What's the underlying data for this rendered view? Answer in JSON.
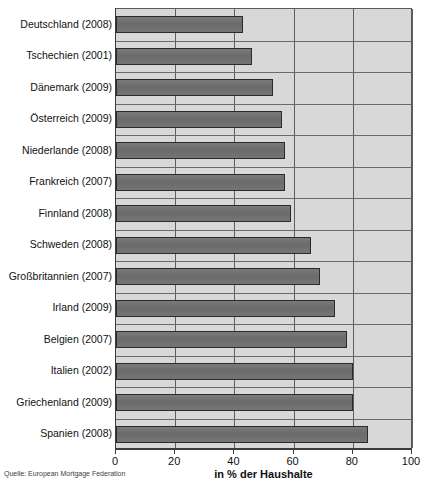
{
  "chart_data": {
    "type": "bar",
    "orientation": "horizontal",
    "title": "",
    "xlabel": "in % der Haushalte",
    "ylabel": "",
    "xlim": [
      0,
      100
    ],
    "xticks": [
      0,
      20,
      40,
      60,
      80,
      100
    ],
    "grid": true,
    "legend": null,
    "source": "Quelle: European Mortgage Federation",
    "categories": [
      "Deutschland (2008)",
      "Tschechien (2001)",
      "Dänemark (2009)",
      "Österreich (2009)",
      "Niederlande (2008)",
      "Frankreich (2007)",
      "Finnland (2008)",
      "Schweden (2008)",
      "Großbritannien (2007)",
      "Irland (2009)",
      "Belgien (2007)",
      "Italien (2002)",
      "Griechenland (2009)",
      "Spanien (2008)"
    ],
    "values": [
      43,
      46,
      53,
      56,
      57,
      57,
      59,
      66,
      69,
      74,
      78,
      80,
      80,
      85
    ],
    "colors": {
      "bar_fill": "#6f6f6f",
      "bar_border": "#2b2b2b",
      "plot_background": "#d8d8d8",
      "gridline": "#5e5e5e",
      "text": "#111111"
    }
  },
  "axis": {
    "tick_labels": [
      "0",
      "20",
      "40",
      "60",
      "80",
      "100"
    ],
    "title": "in % der Haushalte"
  },
  "footer": {
    "source": "Quelle: European Mortgage Federation"
  }
}
